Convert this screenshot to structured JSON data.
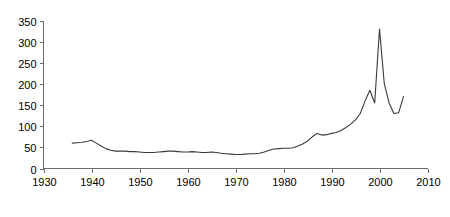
{
  "chart_data": {
    "type": "line",
    "title": "",
    "subtitle": "",
    "xlabel": "",
    "ylabel": "",
    "xlim": [
      1930,
      2010
    ],
    "ylim": [
      0,
      350
    ],
    "grid": false,
    "legend": false,
    "legend_position": "none",
    "line_color": "#3a3a3a",
    "axis_color": "#6b6b6b",
    "xticks": [
      1930,
      1940,
      1950,
      1960,
      1970,
      1980,
      1990,
      2000,
      2010
    ],
    "xtick_labels": [
      "1930",
      "1940",
      "1950",
      "1960",
      "1970",
      "1980",
      "1990",
      "2000",
      "2010"
    ],
    "yticks": [
      0,
      50,
      100,
      150,
      200,
      250,
      300,
      350
    ],
    "ytick_labels": [
      "0",
      "50",
      "100",
      "150",
      "200",
      "250",
      "300",
      "350"
    ],
    "series": [
      {
        "name": "series-1",
        "x": [
          1936,
          1937,
          1938,
          1939,
          1940,
          1941,
          1942,
          1943,
          1944,
          1945,
          1946,
          1947,
          1948,
          1949,
          1950,
          1951,
          1952,
          1953,
          1954,
          1955,
          1956,
          1957,
          1958,
          1959,
          1960,
          1961,
          1962,
          1963,
          1964,
          1965,
          1966,
          1967,
          1968,
          1969,
          1970,
          1971,
          1972,
          1973,
          1974,
          1975,
          1976,
          1977,
          1978,
          1979,
          1980,
          1981,
          1982,
          1983,
          1984,
          1985,
          1986,
          1987,
          1988,
          1989,
          1990,
          1991,
          1992,
          1993,
          1994,
          1995,
          1996,
          1997,
          1998,
          1999,
          2000,
          2001,
          2002,
          2003,
          2004,
          2005
        ],
        "values": [
          60,
          61,
          62,
          64,
          67,
          60,
          53,
          47,
          43,
          41,
          41,
          41,
          40,
          40,
          39,
          38,
          38,
          38,
          39,
          40,
          41,
          41,
          40,
          39,
          39,
          40,
          39,
          38,
          38,
          39,
          38,
          36,
          35,
          34,
          33,
          33,
          34,
          35,
          35,
          36,
          39,
          43,
          46,
          47,
          48,
          48,
          49,
          53,
          58,
          65,
          75,
          83,
          79,
          80,
          83,
          85,
          90,
          97,
          105,
          115,
          130,
          160,
          185,
          155,
          330,
          200,
          155,
          130,
          132,
          170
        ]
      }
    ]
  }
}
